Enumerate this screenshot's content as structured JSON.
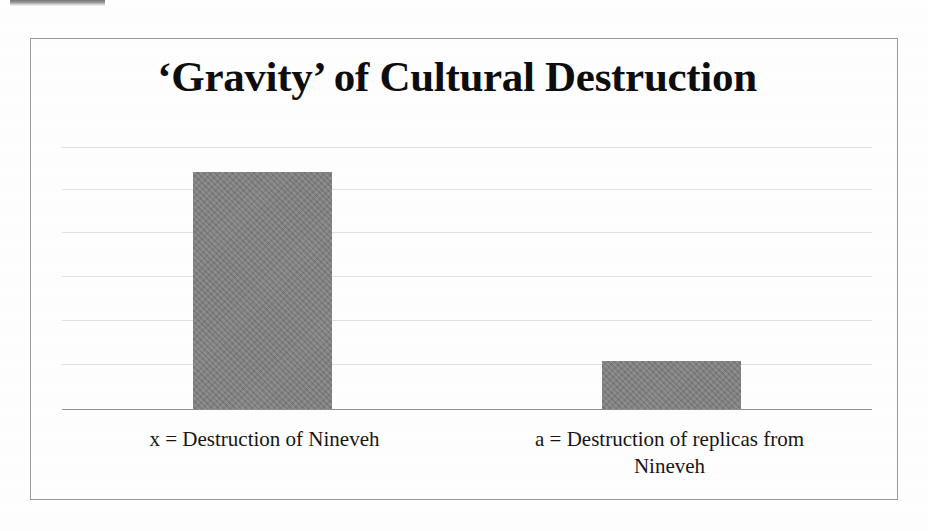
{
  "document": {
    "kind": "scanned-slide",
    "background_color": "#fefefe",
    "border_color": "#9a9a9a"
  },
  "chart_data": {
    "type": "bar",
    "title": "‘Gravity’ of Cultural Destruction",
    "xlabel": "",
    "ylabel": "",
    "categories": [
      "x = Destruction of Nineveh",
      "a = Destruction of replicas from Nineveh"
    ],
    "values": [
      5.1,
      1.05
    ],
    "ylim": [
      0,
      6
    ],
    "grid": true,
    "gridline_count": 6,
    "legend": "none",
    "bar_color": "#808080",
    "series": [
      {
        "name": "Gravity",
        "values": [
          5.1,
          1.05
        ]
      }
    ]
  },
  "labels": {
    "category_x_line1": "x = Destruction of Nineveh",
    "category_a_line1": "a = Destruction of replicas from",
    "category_a_line2": "Nineveh"
  }
}
